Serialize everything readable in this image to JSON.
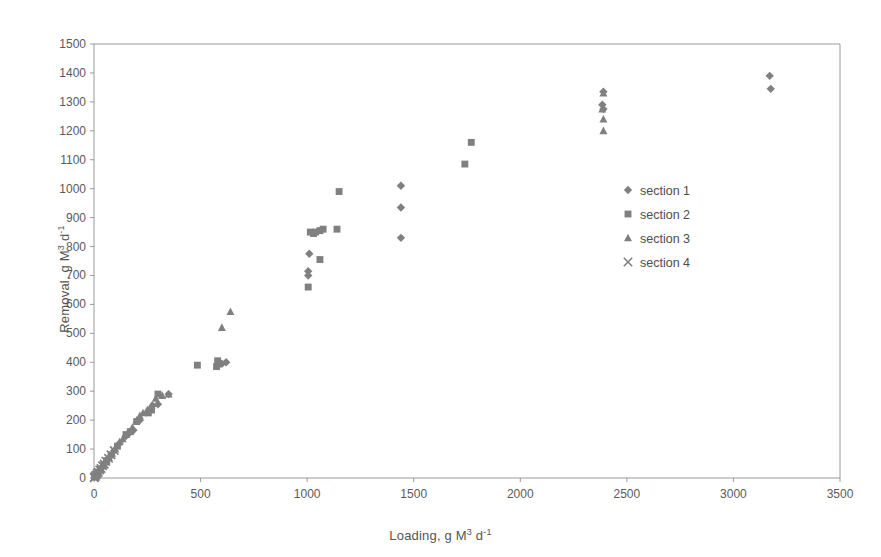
{
  "chart_data": {
    "type": "scatter",
    "title": "",
    "xlabel": "Loading, g M3 d-1",
    "ylabel": "Removal, g M3 d-1",
    "xlabel_parts": {
      "base": "Loading, g M",
      "sup1": "3",
      "mid": " d",
      "sup2": "-1"
    },
    "ylabel_parts": {
      "base": "Removal, g M",
      "sup1": "3",
      "mid": " d",
      "sup2": "-1"
    },
    "xlim": [
      0,
      3500
    ],
    "ylim": [
      0,
      1500
    ],
    "xticks": [
      0,
      500,
      1000,
      1500,
      2000,
      2500,
      3000,
      3500
    ],
    "yticks": [
      0,
      100,
      200,
      300,
      400,
      500,
      600,
      700,
      800,
      900,
      1000,
      1100,
      1200,
      1300,
      1400,
      1500
    ],
    "grid": false,
    "legend_position": "inside-right",
    "marker_color": "#808080",
    "axis_color": "#9a9a9a",
    "series": [
      {
        "name": "section 1",
        "marker": "diamond",
        "points": [
          [
            3170,
            1390
          ],
          [
            3175,
            1345
          ],
          [
            2390,
            1335
          ],
          [
            2385,
            1290
          ],
          [
            2390,
            1275
          ],
          [
            1440,
            1010
          ],
          [
            1440,
            935
          ],
          [
            1440,
            830
          ],
          [
            1010,
            775
          ],
          [
            1005,
            715
          ],
          [
            1005,
            700
          ],
          [
            620,
            400
          ],
          [
            600,
            395
          ],
          [
            585,
            390
          ],
          [
            350,
            290
          ],
          [
            300,
            255
          ],
          [
            275,
            250
          ],
          [
            255,
            230
          ],
          [
            215,
            200
          ],
          [
            185,
            165
          ],
          [
            165,
            155
          ],
          [
            150,
            145
          ],
          [
            120,
            120
          ],
          [
            95,
            95
          ],
          [
            70,
            70
          ],
          [
            55,
            55
          ],
          [
            40,
            40
          ],
          [
            30,
            30
          ],
          [
            22,
            22
          ],
          [
            15,
            15
          ],
          [
            8,
            8
          ],
          [
            3,
            3
          ]
        ]
      },
      {
        "name": "section 2",
        "marker": "square",
        "points": [
          [
            1770,
            1160
          ],
          [
            1740,
            1085
          ],
          [
            1150,
            990
          ],
          [
            1140,
            860
          ],
          [
            1075,
            860
          ],
          [
            1060,
            855
          ],
          [
            1040,
            850
          ],
          [
            1030,
            845
          ],
          [
            1015,
            850
          ],
          [
            1060,
            755
          ],
          [
            1005,
            660
          ],
          [
            580,
            405
          ],
          [
            575,
            385
          ],
          [
            485,
            390
          ],
          [
            300,
            290
          ],
          [
            270,
            235
          ],
          [
            255,
            225
          ],
          [
            200,
            195
          ],
          [
            170,
            160
          ],
          [
            150,
            150
          ],
          [
            110,
            110
          ],
          [
            80,
            80
          ],
          [
            60,
            60
          ],
          [
            45,
            45
          ],
          [
            30,
            30
          ],
          [
            20,
            20
          ],
          [
            12,
            12
          ],
          [
            5,
            5
          ]
        ]
      },
      {
        "name": "section 3",
        "marker": "triangle",
        "points": [
          [
            2390,
            1330
          ],
          [
            2385,
            1275
          ],
          [
            2390,
            1240
          ],
          [
            2390,
            1200
          ],
          [
            640,
            575
          ],
          [
            600,
            520
          ],
          [
            350,
            290
          ],
          [
            320,
            285
          ],
          [
            290,
            275
          ],
          [
            270,
            250
          ],
          [
            250,
            235
          ],
          [
            230,
            225
          ],
          [
            215,
            215
          ],
          [
            200,
            200
          ],
          [
            180,
            175
          ],
          [
            165,
            160
          ],
          [
            150,
            150
          ],
          [
            135,
            135
          ],
          [
            120,
            125
          ],
          [
            100,
            100
          ],
          [
            85,
            85
          ],
          [
            70,
            70
          ],
          [
            55,
            55
          ],
          [
            42,
            42
          ],
          [
            30,
            30
          ],
          [
            20,
            20
          ],
          [
            10,
            10
          ],
          [
            4,
            4
          ]
        ]
      },
      {
        "name": "section 4",
        "marker": "cross",
        "points": [
          [
            95,
            95
          ],
          [
            80,
            80
          ],
          [
            68,
            68
          ],
          [
            55,
            58
          ],
          [
            48,
            48
          ],
          [
            40,
            42
          ],
          [
            33,
            33
          ],
          [
            27,
            28
          ],
          [
            20,
            20
          ],
          [
            15,
            16
          ],
          [
            10,
            10
          ],
          [
            6,
            6
          ],
          [
            3,
            3
          ],
          [
            1,
            1
          ]
        ]
      }
    ]
  },
  "legend": {
    "items": [
      {
        "label": "section 1",
        "marker": "diamond"
      },
      {
        "label": "section 2",
        "marker": "square"
      },
      {
        "label": "section 3",
        "marker": "triangle"
      },
      {
        "label": "section 4",
        "marker": "cross"
      }
    ]
  }
}
